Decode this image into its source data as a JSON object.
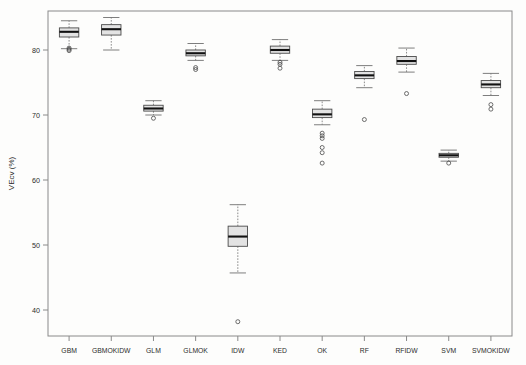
{
  "chart_data": {
    "type": "box",
    "title": "",
    "xlabel": "",
    "ylabel": "VEcv (%)",
    "ylim": [
      36,
      86
    ],
    "yticks": [
      40,
      50,
      60,
      70,
      80
    ],
    "grid": false,
    "legend": "none",
    "categories": [
      "GBM",
      "GBMOKIDW",
      "GLM",
      "GLMOK",
      "IDW",
      "KED",
      "OK",
      "RF",
      "RFIDW",
      "SVM",
      "SVMOKIDW"
    ],
    "boxes": [
      {
        "label": "GBM",
        "min": 80.2,
        "q1": 82.0,
        "median": 82.8,
        "q3": 83.4,
        "max": 84.5,
        "outliers": [
          80.3,
          80.1,
          79.9
        ]
      },
      {
        "label": "GBMOKIDW",
        "min": 80.0,
        "q1": 82.3,
        "median": 83.2,
        "q3": 83.9,
        "max": 85.0,
        "outliers": []
      },
      {
        "label": "GLM",
        "min": 70.0,
        "q1": 70.6,
        "median": 71.0,
        "q3": 71.5,
        "max": 72.2,
        "outliers": [
          69.5
        ]
      },
      {
        "label": "GLMOK",
        "min": 78.4,
        "q1": 79.1,
        "median": 79.5,
        "q3": 80.0,
        "max": 81.0,
        "outliers": [
          77.3,
          77.0
        ]
      },
      {
        "label": "IDW",
        "min": 45.7,
        "q1": 49.8,
        "median": 51.3,
        "q3": 52.9,
        "max": 56.2,
        "outliers": [
          38.2
        ]
      },
      {
        "label": "KED",
        "min": 78.4,
        "q1": 79.5,
        "median": 80.0,
        "q3": 80.6,
        "max": 81.6,
        "outliers": [
          78.1,
          77.8,
          77.2
        ]
      },
      {
        "label": "OK",
        "min": 68.5,
        "q1": 69.6,
        "median": 70.1,
        "q3": 70.9,
        "max": 72.2,
        "outliers": [
          67.2,
          66.8,
          66.4,
          65.0,
          64.2,
          62.6
        ]
      },
      {
        "label": "RF",
        "min": 74.2,
        "q1": 75.6,
        "median": 76.1,
        "q3": 76.7,
        "max": 77.6,
        "outliers": [
          69.3
        ]
      },
      {
        "label": "RFIDW",
        "min": 76.6,
        "q1": 77.8,
        "median": 78.3,
        "q3": 79.0,
        "max": 80.3,
        "outliers": [
          73.3
        ]
      },
      {
        "label": "SVM",
        "min": 62.9,
        "q1": 63.5,
        "median": 63.8,
        "q3": 64.1,
        "max": 64.6,
        "outliers": [
          62.6
        ]
      },
      {
        "label": "SVMOKIDW",
        "min": 73.0,
        "q1": 74.2,
        "median": 74.7,
        "q3": 75.3,
        "max": 76.4,
        "outliers": [
          71.6,
          70.9
        ]
      }
    ]
  },
  "colors": {
    "box_fill": "#e3e3e3",
    "box_stroke": "#4a4a4a",
    "median": "#111111",
    "axis": "#8a8a8a",
    "text": "#2b2b2b",
    "background": "#fdfdfc"
  }
}
